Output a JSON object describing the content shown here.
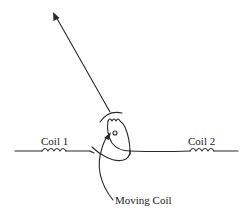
{
  "diagram": {
    "labels": {
      "coil1": "Coil 1",
      "coil2": "Coil 2",
      "moving_coil": "Moving Coil"
    },
    "colors": {
      "line": "#2a2a2a",
      "background": "#ffffff"
    }
  }
}
